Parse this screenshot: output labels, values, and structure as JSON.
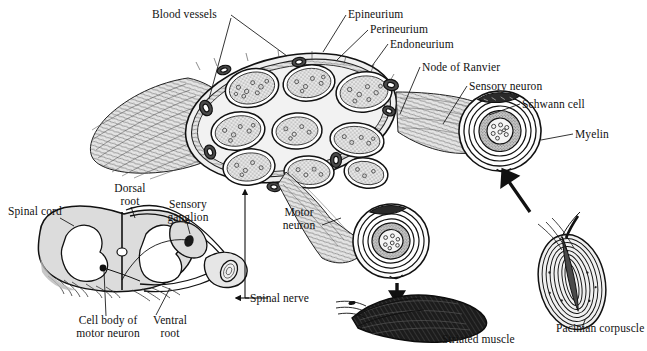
{
  "figure": {
    "background_color": "#ffffff",
    "ink_color": "#111111",
    "tissue_fill": "#d9d9d9",
    "muscle_fill": "#1a1a1a"
  },
  "labels": {
    "blood_vessels": "Blood vessels",
    "epineurium": "Epineurium",
    "perineurium": "Perineurium",
    "endoneurium": "Endoneurium",
    "node_of_ranvier": "Node of Ranvier",
    "sensory_neuron": "Sensory neuron",
    "schwann_cell": "Schwann cell",
    "myelin": "Myelin",
    "spinal_cord": "Spinal cord",
    "dorsal_root": "Dorsal\nroot",
    "sensory_ganglion": "Sensory\nganglion",
    "cell_body_of_motor_neuron": "Cell body of\nmotor neuron",
    "ventral_root": "Ventral\nroot",
    "spinal_nerve": "Spinal nerve",
    "motor_neuron": "Motor\nneuron",
    "striated_muscle": "Striated muscle",
    "pacinian_corpuscle": "Pacinian corpuscle"
  },
  "structures": [
    {
      "name": "nerve-trunk",
      "description": "Cut peripheral nerve trunk showing fascicles in cross-section"
    },
    {
      "name": "fascicle",
      "description": "Bundle of axons wrapped in perineurium",
      "count": 9
    },
    {
      "name": "spinal-cord-cross-section",
      "description": "Spinal cord with butterfly-shaped gray matter, dorsal and ventral roots"
    },
    {
      "name": "motor-neuron-axon",
      "description": "Myelinated motor axon ending on striated muscle"
    },
    {
      "name": "sensory-neuron-axon",
      "description": "Myelinated sensory axon from Pacinian corpuscle"
    },
    {
      "name": "striated-muscle",
      "description": "Skeletal muscle fibers"
    },
    {
      "name": "pacinian-corpuscle",
      "description": "Lamellated pressure receptor"
    }
  ]
}
